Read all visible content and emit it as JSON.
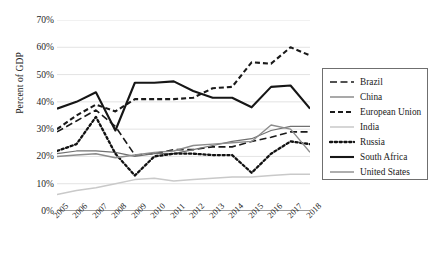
{
  "chart_data": {
    "type": "line",
    "title": "",
    "xlabel": "",
    "ylabel": "Percent of GDP",
    "ylim": [
      0,
      70
    ],
    "ytick_labels": [
      "0%",
      "10%",
      "20%",
      "30%",
      "40%",
      "50%",
      "60%",
      "70%"
    ],
    "ytick_values": [
      0,
      10,
      20,
      30,
      40,
      50,
      60,
      70
    ],
    "grid": true,
    "legend_position": "right",
    "x": [
      2005,
      2006,
      2007,
      2008,
      2009,
      2010,
      2011,
      2012,
      2013,
      2014,
      2015,
      2016,
      2017,
      2018
    ],
    "categories": [
      "2005",
      "2006",
      "2007",
      "2008",
      "2009",
      "2010",
      "2011",
      "2012",
      "2013",
      "2014",
      "2015",
      "2016",
      "2017",
      "2018"
    ],
    "series": [
      {
        "name": "Brazil",
        "style": "dashed",
        "color": "#1a1a1a",
        "width": 1.6,
        "dash": "7,3.5",
        "values": [
          29,
          33,
          37,
          31,
          20.5,
          21,
          22.5,
          22.5,
          23.5,
          23.5,
          25.5,
          27,
          29,
          29
        ]
      },
      {
        "name": "China",
        "style": "solid",
        "color": "#707070",
        "width": 1.2,
        "dash": "",
        "values": [
          21,
          22,
          22,
          21.5,
          20,
          21,
          21,
          22.5,
          24,
          25.5,
          26.5,
          29.5,
          31,
          31
        ]
      },
      {
        "name": "European Union",
        "style": "dashed",
        "color": "#1a1a1a",
        "width": 2.1,
        "dash": "5,3",
        "values": [
          30,
          35,
          39,
          36.5,
          41,
          41,
          41,
          41.5,
          45,
          45.5,
          54.5,
          54,
          60,
          57
        ]
      },
      {
        "name": "India",
        "style": "solid",
        "color": "#c9c9c9",
        "width": 1.5,
        "dash": "",
        "values": [
          6,
          7.5,
          8.5,
          10,
          11.5,
          12,
          11,
          11.5,
          12,
          12.5,
          12.5,
          13,
          13.5,
          13.5
        ]
      },
      {
        "name": "Russia",
        "style": "dotted",
        "color": "#111111",
        "width": 2.3,
        "dash": "2.2,2.6",
        "values": [
          22,
          24.5,
          34.5,
          21,
          13,
          20,
          21,
          21,
          20.5,
          20.5,
          14,
          21,
          25.5,
          24.5
        ]
      },
      {
        "name": "South Africa",
        "style": "solid",
        "color": "#161616",
        "width": 2.1,
        "dash": "",
        "values": [
          37.5,
          40,
          43.5,
          29.5,
          47,
          47,
          47.5,
          44,
          41.5,
          41.5,
          38,
          45.5,
          46,
          37.5
        ]
      },
      {
        "name": "United States",
        "style": "solid",
        "color": "#8c8c8c",
        "width": 1.4,
        "dash": "",
        "values": [
          20,
          20.5,
          21,
          19.5,
          20.5,
          21.5,
          22,
          24,
          24.5,
          25,
          25.5,
          31.5,
          30,
          21.5
        ]
      }
    ]
  }
}
